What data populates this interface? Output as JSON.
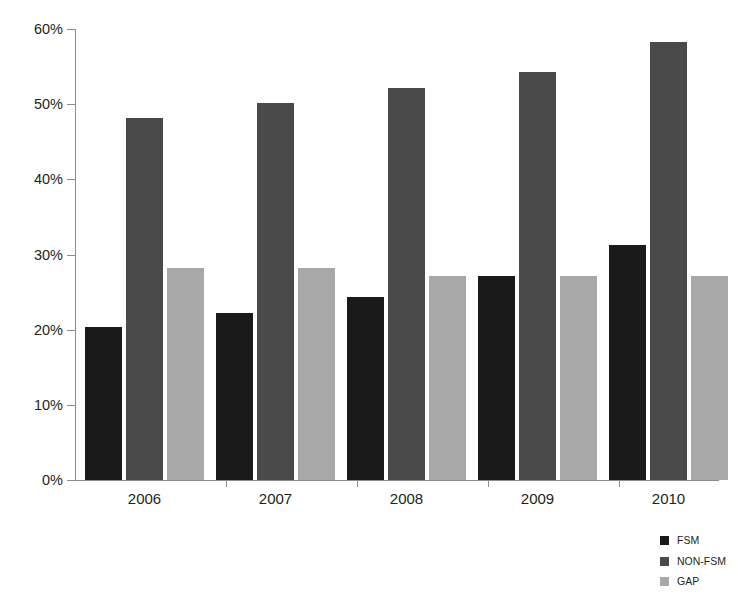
{
  "chart_data": {
    "type": "bar",
    "title": "",
    "xlabel": "",
    "ylabel": "",
    "categories": [
      "2006",
      "2007",
      "2008",
      "2009",
      "2010"
    ],
    "series": [
      {
        "name": "FSM",
        "color": "#1a1a1a",
        "values": [
          20.3,
          22.2,
          24.3,
          27.2,
          31.2
        ]
      },
      {
        "name": "NON-FSM",
        "color": "#4a4a4a",
        "values": [
          48.2,
          50.2,
          52.2,
          54.3,
          58.3
        ]
      },
      {
        "name": "GAP",
        "color": "#a8a8a8",
        "values": [
          28.2,
          28.2,
          27.2,
          27.2,
          27.2
        ]
      }
    ],
    "ylim": [
      0,
      60
    ],
    "ytick_values": [
      0,
      10,
      20,
      30,
      40,
      50,
      60
    ],
    "ytick_labels": [
      "0%",
      "10%",
      "20%",
      "30%",
      "40%",
      "50%",
      "60%"
    ],
    "grid": false,
    "legend_position": "bottom-right",
    "value_suffix": "%"
  },
  "axis": {
    "y_labels": [
      "60%",
      "50%",
      "40%",
      "30%",
      "20%",
      "10%",
      "0%"
    ],
    "x_labels": [
      "2006",
      "2007",
      "2008",
      "2009",
      "2010"
    ]
  },
  "legend": {
    "items": [
      {
        "label": "FSM",
        "key": "fsm"
      },
      {
        "label": "NON-FSM",
        "key": "nonfsm"
      },
      {
        "label": "GAP",
        "key": "gap"
      }
    ]
  }
}
